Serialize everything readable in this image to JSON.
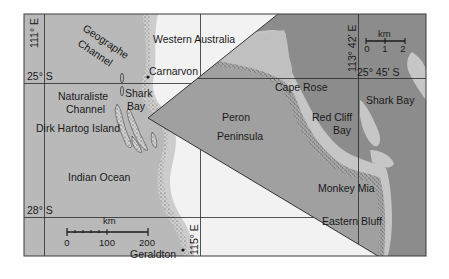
{
  "map": {
    "title": "Shark Bay, Western Australia",
    "colors": {
      "ocean": "#b9b9b9",
      "land": "#f2f2f2",
      "inset_water": "#8c8c8c",
      "inset_land": "#9e9e9e",
      "inset_shallow": "#c6c6c6",
      "grid": "#2a2a2a",
      "frame": "#3a3a3a",
      "text": "#1a1a1a"
    },
    "main_map": {
      "graticule": {
        "lon_111": "111° E",
        "lon_115": "115° E",
        "lat_25": "25° S",
        "lat_28": "28° S"
      },
      "labels": {
        "western_australia": "Western Australia",
        "geographe": "Geographe",
        "channel_1": "Channel",
        "carnarvon": "Carnarvon",
        "naturaliste": "Naturaliste",
        "channel_2": "Channel",
        "shark": "Shark",
        "bay": "Bay",
        "dirk_hartog_island": "Dirk Hartog Island",
        "indian_ocean": "Indian Ocean",
        "geraldton": "Geraldton"
      },
      "scale_bar": {
        "unit": "km",
        "ticks": [
          "0",
          "100",
          "200"
        ]
      }
    },
    "inset_map": {
      "graticule": {
        "lon": "113° 42' E",
        "lat": "25° 45' S"
      },
      "labels": {
        "cape_rose": "Cape Rose",
        "shark_bay": "Shark Bay",
        "peron": "Peron",
        "peninsula": "Peninsula",
        "red_cliff": "Red Cliff",
        "bay": "Bay",
        "monkey_mia": "Monkey Mia",
        "eastern_bluff": "Eastern Bluff"
      },
      "scale_bar": {
        "unit": "km",
        "ticks": [
          "0",
          "1",
          "2"
        ]
      }
    }
  }
}
